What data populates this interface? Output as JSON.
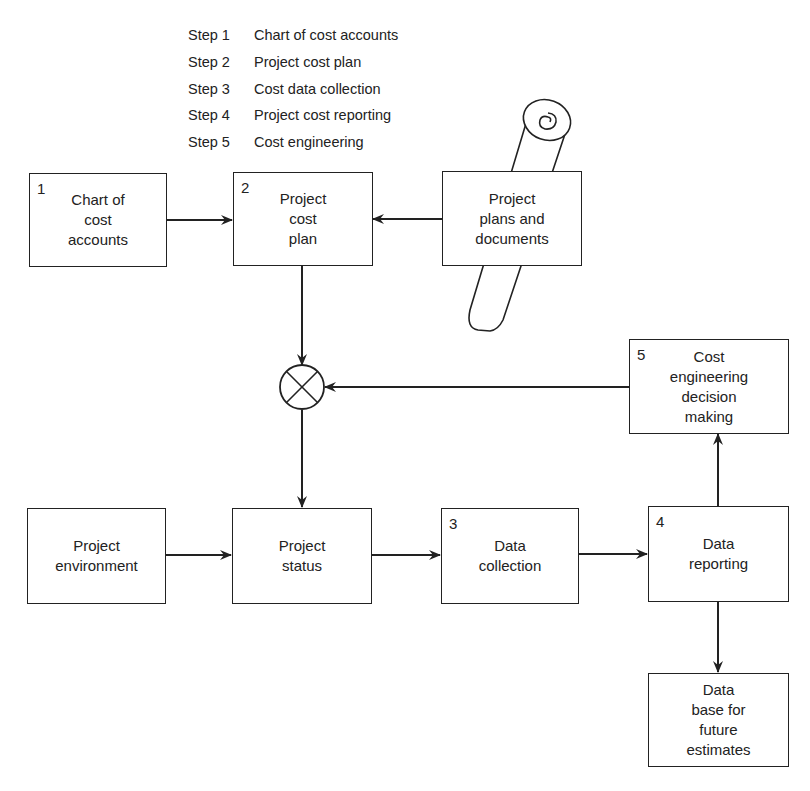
{
  "steps": [
    {
      "label": "Step 1",
      "text": "Chart of cost accounts"
    },
    {
      "label": "Step 2",
      "text": "Project cost plan"
    },
    {
      "label": "Step 3",
      "text": "Cost data collection"
    },
    {
      "label": "Step 4",
      "text": "Project cost reporting"
    },
    {
      "label": "Step 5",
      "text": "Cost engineering"
    }
  ],
  "nodes": {
    "chart_of_accounts": {
      "number": "1",
      "label": "Chart of\ncost\naccounts"
    },
    "project_cost_plan": {
      "number": "2",
      "label": "Project\ncost\nplan"
    },
    "plans_documents": {
      "label": "Project\nplans and\ndocuments"
    },
    "decision_making": {
      "number": "5",
      "label": "Cost\nengineering\ndecision\nmaking"
    },
    "environment": {
      "label": "Project\nenvironment"
    },
    "status": {
      "label": "Project\nstatus"
    },
    "data_collection": {
      "number": "3",
      "label": "Data\ncollection"
    },
    "data_reporting": {
      "number": "4",
      "label": "Data\nreporting"
    },
    "database": {
      "label": "Data\nbase for\nfuture\nestimates"
    }
  },
  "edges": [
    {
      "from": "chart_of_accounts",
      "to": "project_cost_plan"
    },
    {
      "from": "plans_documents",
      "to": "project_cost_plan"
    },
    {
      "from": "project_cost_plan",
      "to": "comparator"
    },
    {
      "from": "decision_making",
      "to": "comparator"
    },
    {
      "from": "comparator",
      "to": "status"
    },
    {
      "from": "environment",
      "to": "status"
    },
    {
      "from": "status",
      "to": "data_collection"
    },
    {
      "from": "data_collection",
      "to": "data_reporting"
    },
    {
      "from": "data_reporting",
      "to": "decision_making"
    },
    {
      "from": "data_reporting",
      "to": "database"
    }
  ],
  "icons": {
    "comparator": "circle-x-summing-junction",
    "scroll": "rolled-document-scroll"
  }
}
